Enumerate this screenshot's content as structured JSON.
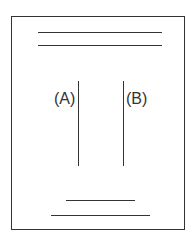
{
  "diagram": {
    "labels": {
      "a": "(A)",
      "b": "(B)"
    },
    "elements": [
      {
        "type": "frame",
        "x": 11,
        "y": 16,
        "w": 174,
        "h": 214
      },
      {
        "type": "hline",
        "name": "top-line-1",
        "x1": 38,
        "x2": 162,
        "y": 32
      },
      {
        "type": "hline",
        "name": "top-line-2",
        "x1": 38,
        "x2": 162,
        "y": 45
      },
      {
        "type": "vline",
        "name": "line-a",
        "x": 78,
        "y1": 81,
        "y2": 166
      },
      {
        "type": "vline",
        "name": "line-b",
        "x": 123,
        "y1": 81,
        "y2": 166
      },
      {
        "type": "hline",
        "name": "bottom-line-1",
        "x1": 66,
        "x2": 135,
        "y": 200
      },
      {
        "type": "hline",
        "name": "bottom-line-2",
        "x1": 51,
        "x2": 150,
        "y": 215
      }
    ]
  }
}
